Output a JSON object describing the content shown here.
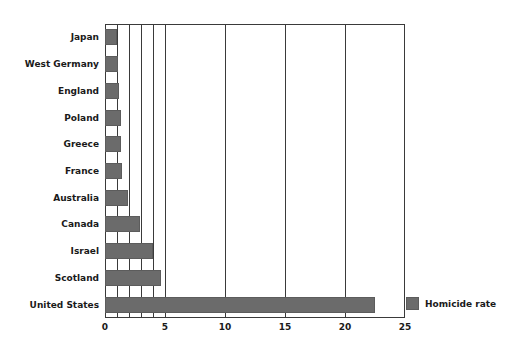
{
  "chart_data": {
    "type": "bar",
    "orientation": "horizontal",
    "title": "",
    "xlabel": "",
    "ylabel": "",
    "categories": [
      "Japan",
      "West Germany",
      "England",
      "Poland",
      "Greece",
      "France",
      "Australia",
      "Canada",
      "Israel",
      "Scotland",
      "United States"
    ],
    "series": [
      {
        "name": "Homicide rate",
        "color": "#6b6b6b",
        "values": [
          1.0,
          1.1,
          1.2,
          1.3,
          1.3,
          1.4,
          1.9,
          2.9,
          4.0,
          4.7,
          22.5
        ]
      }
    ],
    "xlim": [
      0,
      25
    ],
    "xticks": [
      0,
      5,
      10,
      15,
      20,
      25
    ],
    "xticklabels": [
      "0",
      "5",
      "10",
      "15",
      "20",
      "25"
    ],
    "gridlines": [
      1,
      2,
      3,
      4,
      5,
      10,
      15,
      20
    ],
    "grid": true,
    "legend": {
      "position": "right",
      "entries": [
        {
          "label": "Homicide rate",
          "color": "#6b6b6b"
        }
      ]
    },
    "colors": {
      "bar": "#6b6b6b",
      "axis": "#3a3a3a",
      "text": "#1a1a1a",
      "background": "#ffffff"
    }
  }
}
